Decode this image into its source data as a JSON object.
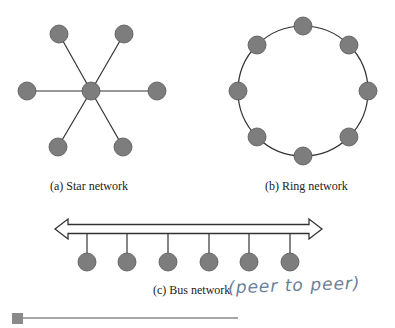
{
  "colors": {
    "node_fill": "#7d7d7d",
    "node_stroke": "#555555",
    "line": "#333333",
    "handwriting": "#6a7f9a",
    "bar": "#8a8a8a"
  },
  "star": {
    "label": "(a) Star network",
    "hub": {
      "x": 91,
      "y": 91
    },
    "nodes": [
      {
        "x": 59,
        "y": 34
      },
      {
        "x": 124,
        "y": 34
      },
      {
        "x": 27,
        "y": 91
      },
      {
        "x": 157,
        "y": 91
      },
      {
        "x": 58,
        "y": 147
      },
      {
        "x": 123,
        "y": 147
      }
    ]
  },
  "ring": {
    "label": "(b) Ring network",
    "center": {
      "x": 303,
      "y": 91
    },
    "radius": 65,
    "node_count": 8
  },
  "bus": {
    "label": "(c) Bus network",
    "annotation": "(peer to peer)",
    "backbone": {
      "x1": 55,
      "x2": 322,
      "y": 229
    },
    "nodes": [
      {
        "x": 87
      },
      {
        "x": 127
      },
      {
        "x": 168
      },
      {
        "x": 209
      },
      {
        "x": 249
      },
      {
        "x": 290
      }
    ],
    "node_y": 262
  },
  "footer_bar": {
    "x1": 12,
    "x2": 238,
    "y": 318
  }
}
